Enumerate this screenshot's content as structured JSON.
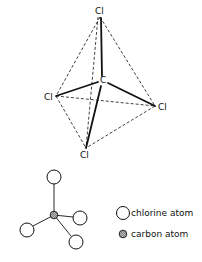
{
  "diagram": {
    "tetrahedron": {
      "labels": {
        "top": "Cl",
        "left": "Cl",
        "right": "Cl",
        "bottom": "Cl",
        "center": "C"
      }
    },
    "legend": {
      "chlorine": "chlorine atom",
      "carbon": "carbon atom"
    },
    "colors": {
      "line": "#111111",
      "carbon_fill": "#9a9a9a",
      "chlorine_fill": "#ffffff"
    }
  }
}
